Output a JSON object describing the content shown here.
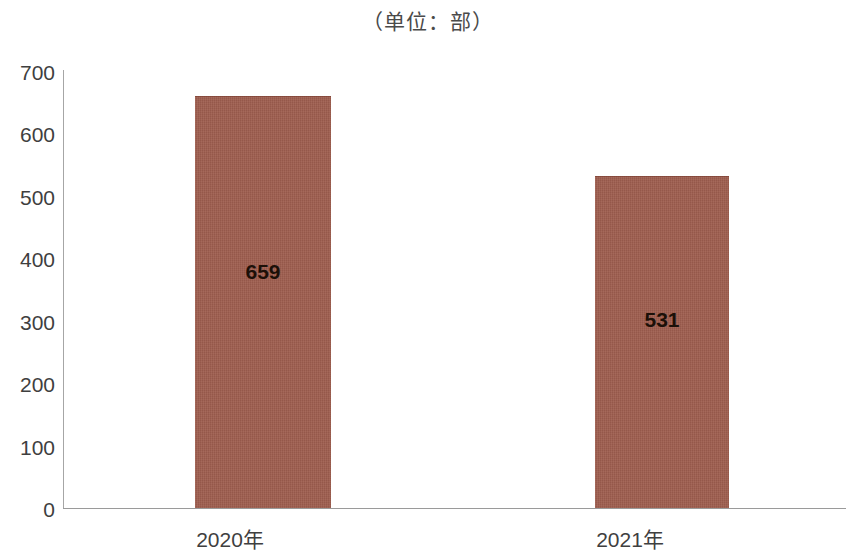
{
  "chart_data": {
    "type": "bar",
    "title": "（单位：部）",
    "xlabel": "",
    "ylabel": "",
    "categories": [
      "2020年",
      "2021年"
    ],
    "values": [
      659,
      531
    ],
    "value_labels": [
      "659",
      "531"
    ],
    "ylim": [
      0,
      700
    ],
    "yticks": [
      0,
      100,
      200,
      300,
      400,
      500,
      600,
      700
    ],
    "ytick_labels": [
      "0",
      "100",
      "200",
      "300",
      "400",
      "500",
      "600",
      "700"
    ],
    "grid": false,
    "legend": false,
    "legend_position": "none",
    "series": [
      {
        "name": "",
        "values": [
          659,
          531
        ]
      }
    ],
    "colors": {
      "bar_fill": "#9e5d4e",
      "axis_line": "#9a9a9a",
      "tick_text": "#3f3f3f",
      "value_label_text": "#1c1008",
      "title_text": "#4a4a4a",
      "background": "#ffffff"
    }
  }
}
